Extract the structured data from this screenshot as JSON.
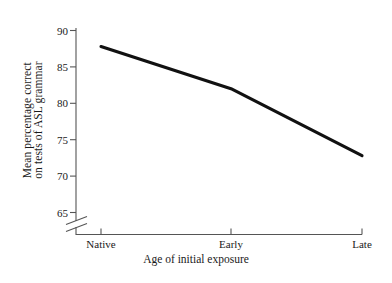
{
  "chart_data": {
    "type": "line",
    "title": "",
    "xlabel": "Age of initial exposure",
    "ylabel_line1": "Mean percentage correct",
    "ylabel_line2": "on tests of ASL grammar",
    "categories": [
      "Native",
      "Early",
      "Late"
    ],
    "values": [
      87.8,
      82.0,
      72.8
    ],
    "series": [
      {
        "name": "Mean percentage correct on tests of ASL grammar",
        "values": [
          87.8,
          82.0,
          72.8
        ]
      }
    ],
    "y_ticks": [
      65,
      70,
      75,
      80,
      85,
      90
    ],
    "y_tick_labels": [
      "65",
      "70",
      "75",
      "80",
      "85",
      "90"
    ],
    "ylim": [
      65,
      90
    ],
    "x_tick_labels": [
      "Native",
      "Early",
      "Late"
    ],
    "grid": false,
    "legend": false,
    "legend_position": "none",
    "axis_break": true,
    "axis_break_note": "y-axis broken below 65",
    "line_color": "#111111",
    "axis_color": "#555555",
    "text_color": "#1a1a1a",
    "background_color": "#ffffff"
  }
}
